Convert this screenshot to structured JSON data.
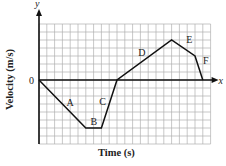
{
  "chart_data": {
    "type": "line",
    "title": "",
    "xlabel": "Time (s)",
    "ylabel": "Velocity (m/s)",
    "axis_x_name": "x",
    "axis_y_name": "y",
    "origin_label": "0",
    "grid": true,
    "grid_cols": 22,
    "grid_rows": 15,
    "origin_row_from_top": 7,
    "points": [
      {
        "x": 0,
        "y": 0
      },
      {
        "x": 6,
        "y": -6
      },
      {
        "x": 8,
        "y": -6
      },
      {
        "x": 10,
        "y": 0
      },
      {
        "x": 17,
        "y": 5
      },
      {
        "x": 20,
        "y": 3
      },
      {
        "x": 21,
        "y": 0
      }
    ],
    "segments": [
      {
        "label": "A",
        "from": [
          0,
          0
        ],
        "to": [
          6,
          -6
        ]
      },
      {
        "label": "B",
        "from": [
          6,
          -6
        ],
        "to": [
          8,
          -6
        ]
      },
      {
        "label": "C",
        "from": [
          8,
          -6
        ],
        "to": [
          10,
          0
        ]
      },
      {
        "label": "D",
        "from": [
          10,
          0
        ],
        "to": [
          17,
          5
        ]
      },
      {
        "label": "E",
        "from": [
          17,
          5
        ],
        "to": [
          20,
          3
        ]
      },
      {
        "label": "F",
        "from": [
          20,
          3
        ],
        "to": [
          21,
          0
        ]
      }
    ],
    "xlim": [
      0,
      22
    ],
    "ylim": [
      -8,
      7
    ]
  },
  "colors": {
    "grid": "#b0b0b0",
    "axis": "#111111",
    "line": "#111111"
  }
}
